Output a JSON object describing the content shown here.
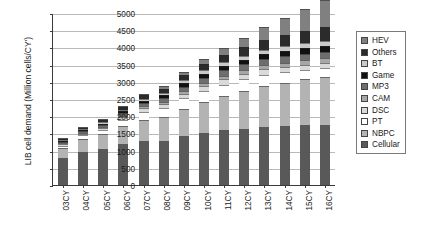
{
  "chart_data": {
    "type": "bar",
    "stacked": true,
    "title": "",
    "xlabel": "",
    "ylabel": "LIB cell demand (Million cells/CY')",
    "ylim": [
      0,
      5000
    ],
    "ytick_step": 500,
    "yticks": [
      0,
      500,
      1000,
      1500,
      2000,
      2500,
      3000,
      3500,
      4000,
      4500,
      5000
    ],
    "ytick_labels": [
      "0",
      "500",
      "1000",
      "1500",
      "2000",
      "2500",
      "3000",
      "3500",
      "4000",
      "4500",
      "5000"
    ],
    "grid": true,
    "legend_position": "right",
    "categories": [
      "03CY",
      "04CY",
      "05CY",
      "06CY",
      "07CY",
      "08CY",
      "09CY",
      "10CY",
      "11CY",
      "12CY",
      "13CY",
      "14CY",
      "15CY",
      "16CY"
    ],
    "series": [
      {
        "name": "Cellular",
        "color": "#595959",
        "values": [
          780,
          960,
          1040,
          1190,
          1280,
          1280,
          1420,
          1520,
          1600,
          1640,
          1700,
          1720,
          1740,
          1750
        ]
      },
      {
        "name": "NBPC",
        "color": "#b3b3b3",
        "values": [
          300,
          380,
          430,
          520,
          620,
          700,
          800,
          900,
          980,
          1080,
          1180,
          1260,
          1340,
          1400
        ]
      },
      {
        "name": "PT",
        "color": "#ffffff",
        "values": [
          60,
          100,
          120,
          180,
          230,
          260,
          300,
          320,
          340,
          350,
          330,
          300,
          270,
          240
        ]
      },
      {
        "name": "DSC",
        "color": "#d9d9d9",
        "values": [
          40,
          50,
          60,
          80,
          100,
          110,
          130,
          140,
          150,
          150,
          150,
          150,
          150,
          150
        ]
      },
      {
        "name": "CAM",
        "color": "#a6a6a6",
        "values": [
          20,
          30,
          40,
          50,
          60,
          70,
          80,
          90,
          100,
          110,
          120,
          130,
          140,
          150
        ]
      },
      {
        "name": "MP3",
        "color": "#6e6e6e",
        "values": [
          30,
          40,
          50,
          70,
          90,
          110,
          130,
          150,
          170,
          180,
          180,
          180,
          180,
          180
        ]
      },
      {
        "name": "Game",
        "color": "#111111",
        "values": [
          20,
          30,
          40,
          50,
          70,
          80,
          100,
          110,
          120,
          130,
          140,
          150,
          160,
          170
        ]
      },
      {
        "name": "BT",
        "color": "#c9c9c9",
        "values": [
          20,
          30,
          40,
          50,
          60,
          70,
          90,
          100,
          110,
          120,
          130,
          140,
          150,
          160
        ]
      },
      {
        "name": "Others",
        "color": "#2b2b2b",
        "values": [
          40,
          50,
          60,
          80,
          100,
          120,
          150,
          180,
          210,
          240,
          280,
          320,
          360,
          400
        ]
      },
      {
        "name": "HEV",
        "color": "#808080",
        "values": [
          10,
          10,
          20,
          30,
          50,
          70,
          100,
          140,
          200,
          280,
          390,
          500,
          640,
          790
        ]
      }
    ],
    "stack_order_bottom_to_top": [
      "Cellular",
      "NBPC",
      "PT",
      "DSC",
      "CAM",
      "MP3",
      "Game",
      "BT",
      "Others",
      "HEV"
    ],
    "totals": [
      1320,
      1680,
      1900,
      2300,
      2660,
      2870,
      3300,
      3650,
      3980,
      4280,
      4600,
      4850,
      5130,
      5390
    ]
  },
  "legend": {
    "items": [
      {
        "label": "HEV",
        "color": "#808080"
      },
      {
        "label": "Others",
        "color": "#2b2b2b"
      },
      {
        "label": "BT",
        "color": "#c9c9c9"
      },
      {
        "label": "Game",
        "color": "#111111"
      },
      {
        "label": "MP3",
        "color": "#6e6e6e"
      },
      {
        "label": "CAM",
        "color": "#a6a6a6"
      },
      {
        "label": "DSC",
        "color": "#d9d9d9"
      },
      {
        "label": "PT",
        "color": "#ffffff"
      },
      {
        "label": "NBPC",
        "color": "#b3b3b3"
      },
      {
        "label": "Cellular",
        "color": "#595959"
      }
    ]
  }
}
